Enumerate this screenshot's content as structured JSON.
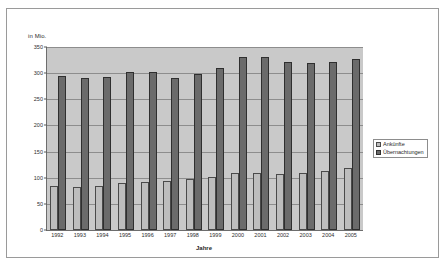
{
  "chart_data": {
    "type": "bar",
    "title": "",
    "xlabel": "Jahre",
    "ylabel": "in Mio.",
    "ylim": [
      0,
      350
    ],
    "yticks": [
      0,
      50,
      100,
      150,
      200,
      250,
      300,
      350
    ],
    "grid": true,
    "legend_position": "right",
    "categories": [
      "1992",
      "1993",
      "1994",
      "1995",
      "1996",
      "1997",
      "1998",
      "1999",
      "2000",
      "2001",
      "2002",
      "2003",
      "2004",
      "2005"
    ],
    "series": [
      {
        "name": "Ankünfte",
        "color": "#bdbdbd",
        "values": [
          85,
          83,
          85,
          89,
          92,
          94,
          97,
          102,
          110,
          110,
          108,
          109,
          113,
          118
        ]
      },
      {
        "name": "Übernachtungen",
        "color": "#6b6b6b",
        "values": [
          295,
          291,
          293,
          302,
          302,
          290,
          298,
          310,
          330,
          330,
          321,
          319,
          321,
          327
        ]
      }
    ]
  },
  "axes": {
    "unit_caption": "in Mio.",
    "x_title": "Jahre",
    "y_tick_labels": [
      "350",
      "300",
      "250",
      "200",
      "150",
      "100",
      "50",
      "0"
    ]
  },
  "legend": {
    "items": [
      {
        "label": "Ankünfte",
        "swatch": "light-gray-swatch"
      },
      {
        "label": "Übernachtungen",
        "swatch": "dark-gray-swatch"
      }
    ]
  },
  "colors": {
    "plot_background": "#c9c9c9",
    "page_background": "#ffffff",
    "arrivals": "#bdbdbd",
    "nights": "#6b6b6b",
    "gridline": "#8d8d8d",
    "axis": "#6d6d6d",
    "frame": "#9a9a9a"
  }
}
